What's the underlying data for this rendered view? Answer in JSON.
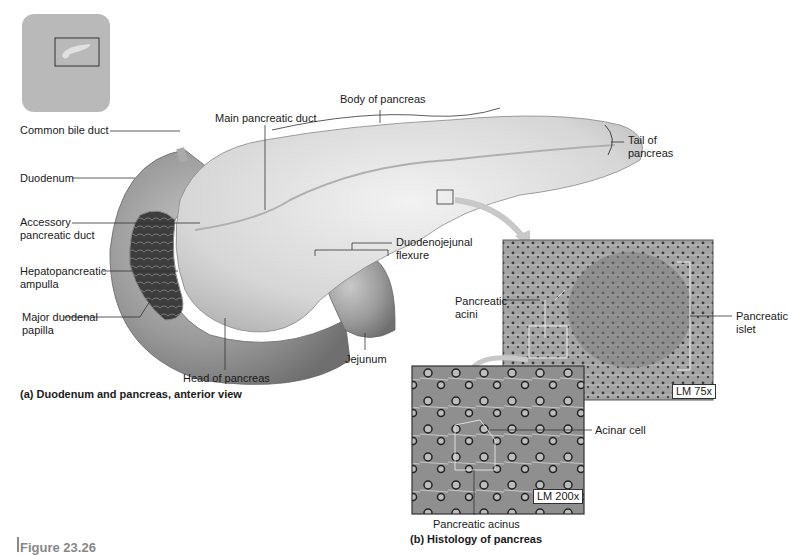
{
  "figure": {
    "number_label": "Figure 23.26",
    "panel_a_caption": "(a) Duodenum and pancreas, anterior view",
    "panel_b_caption": "(b) Histology of pancreas"
  },
  "panel_a_labels": {
    "common_bile_duct": "Common bile duct",
    "duodenum": "Duodenum",
    "accessory_duct_1": "Accessory",
    "accessory_duct_2": "pancreatic duct",
    "hepato_1": "Hepatopancreatic",
    "hepato_2": "ampulla",
    "major_papilla_1": "Major duodenal",
    "major_papilla_2": "papilla",
    "main_duct": "Main pancreatic duct",
    "body": "Body of pancreas",
    "tail_1": "Tail of",
    "tail_2": "pancreas",
    "dj_flexure_1": "Duodenojejunal",
    "dj_flexure_2": "flexure",
    "jejunum": "Jejunum",
    "head": "Head of pancreas"
  },
  "panel_b_labels": {
    "acini_1": "Pancreatic",
    "acini_2": "acini",
    "islet_1": "Pancreatic",
    "islet_2": "islet",
    "acinar_cell": "Acinar cell",
    "acinus": "Pancreatic acinus",
    "mag_low": "LM 75x",
    "mag_high": "LM 200x"
  },
  "colors": {
    "organ_gray": "#9a9a9a",
    "tissue_gray": "#8c8c8c",
    "leader_line": "#333333"
  }
}
